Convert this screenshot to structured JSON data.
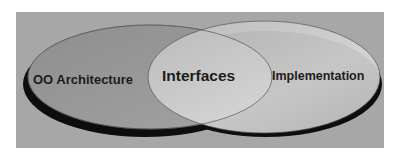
{
  "diagram": {
    "type": "venn",
    "sets": [
      {
        "id": "left",
        "label": "OO Architecture"
      },
      {
        "id": "right",
        "label": "Implementation"
      }
    ],
    "intersection": {
      "label": "Interfaces"
    },
    "colors": {
      "background": "#a7a7a7",
      "left_fill": "#9a9a9a",
      "right_fill": "#c9c9c9",
      "shadow": "#0d0d0d",
      "outline": "#555555",
      "text": "#1c1c1c"
    }
  }
}
